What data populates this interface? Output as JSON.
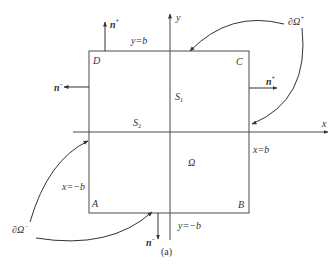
{
  "diagram": {
    "caption": "(a)",
    "colors": {
      "line": "#4a4a4a",
      "text": "#333333",
      "background": "#ffffff"
    },
    "axes": {
      "x_label": "x",
      "y_label": "y"
    },
    "square": {
      "corners": {
        "top_left": "D",
        "top_right": "C",
        "bottom_left": "A",
        "bottom_right": "B"
      },
      "edges": {
        "top": "y=b",
        "bottom": "y=−b",
        "left": "x=−b",
        "right": "x=b"
      }
    },
    "regions": {
      "s1": {
        "main": "S",
        "sub": "1"
      },
      "s2": {
        "main": "S",
        "sub": "2"
      },
      "omega": "Ω"
    },
    "normals": {
      "top": {
        "main": "n",
        "sup": "+"
      },
      "right": {
        "main": "n",
        "sup": "+"
      },
      "left": {
        "main": "n",
        "sup": "−"
      },
      "bottom": {
        "main": "n",
        "sup": "−"
      }
    },
    "boundaries": {
      "plus": {
        "main": "∂Ω",
        "sup": "+"
      },
      "minus": {
        "main": "∂Ω",
        "sup": "−"
      }
    }
  }
}
